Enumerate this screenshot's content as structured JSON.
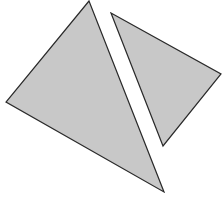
{
  "canvas": {
    "width": 222,
    "height": 198,
    "background": "#ffffff"
  },
  "style": {
    "fill": "#c8c8c8",
    "stroke": "#2a2a2a",
    "stroke_width": 1.2
  },
  "shapes": [
    {
      "name": "left-triangle",
      "points": "89,1 6,102 164,192"
    },
    {
      "name": "right-triangle",
      "points": "111,13 221,74 163,146"
    }
  ]
}
